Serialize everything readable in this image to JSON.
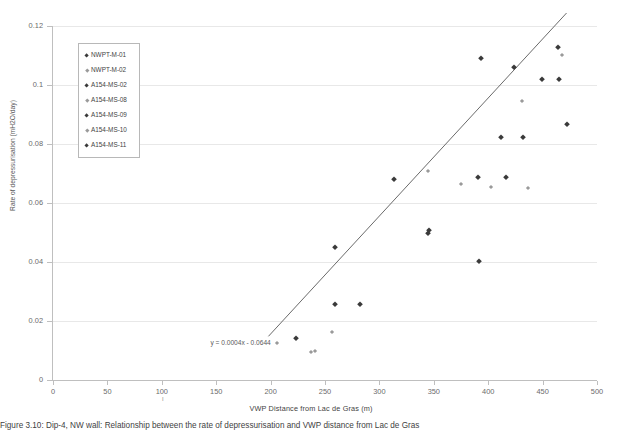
{
  "chart_data": {
    "type": "scatter",
    "title": "",
    "xlabel": "VWP Distance  from Lac de Gras (m)",
    "ylabel": "Rate of depressurisation (mH2O/day)",
    "xlim": [
      0,
      500
    ],
    "ylim": [
      0,
      0.12
    ],
    "xticks": [
      0,
      50,
      100,
      150,
      200,
      250,
      300,
      350,
      400,
      450,
      500
    ],
    "xticklabels": [
      "0",
      "50",
      "100",
      "150",
      "200",
      "250",
      "300",
      "350",
      "400",
      "450",
      "500"
    ],
    "yticks": [
      0,
      0.02,
      0.04,
      0.06,
      0.08,
      0.1,
      0.12
    ],
    "yticklabels": [
      "0",
      "0.02",
      "0.04",
      "0.06",
      "0.08",
      "0.1",
      "0.12"
    ],
    "grid": "horizontal",
    "legend_position": "upper-left-inside",
    "trendline": {
      "equation": "y = 0.0004x - 0.0644",
      "slope": 0.0004,
      "intercept": -0.0644,
      "x_start": 198,
      "x_end": 472
    },
    "series": [
      {
        "name": "NWPT-M-01",
        "marker": "dark",
        "points": [
          {
            "x": 223,
            "y": 0.0143
          },
          {
            "x": 259,
            "y": 0.0258
          },
          {
            "x": 282,
            "y": 0.0257
          },
          {
            "x": 345,
            "y": 0.05
          },
          {
            "x": 346,
            "y": 0.051
          },
          {
            "x": 392,
            "y": 0.0402
          }
        ]
      },
      {
        "name": "NWPT-M-02",
        "marker": "light",
        "points": [
          {
            "x": 206,
            "y": 0.0124
          },
          {
            "x": 241,
            "y": 0.0098
          },
          {
            "x": 256,
            "y": 0.0163
          }
        ]
      },
      {
        "name": "A154-MS-02",
        "marker": "dark",
        "points": [
          {
            "x": 259,
            "y": 0.045
          },
          {
            "x": 313,
            "y": 0.0681
          },
          {
            "x": 391,
            "y": 0.0687
          },
          {
            "x": 416,
            "y": 0.0688
          }
        ]
      },
      {
        "name": "A154-MS-08",
        "marker": "light",
        "points": [
          {
            "x": 237,
            "y": 0.0096
          },
          {
            "x": 345,
            "y": 0.0707
          },
          {
            "x": 375,
            "y": 0.0663
          },
          {
            "x": 403,
            "y": 0.0655
          },
          {
            "x": 437,
            "y": 0.0651
          }
        ]
      },
      {
        "name": "A154-MS-09",
        "marker": "dark",
        "points": [
          {
            "x": 412,
            "y": 0.0825
          },
          {
            "x": 432,
            "y": 0.0825
          },
          {
            "x": 449,
            "y": 0.1022
          },
          {
            "x": 465,
            "y": 0.102
          },
          {
            "x": 472,
            "y": 0.0868
          }
        ]
      },
      {
        "name": "A154-MS-10",
        "marker": "light",
        "points": [
          {
            "x": 431,
            "y": 0.0945
          },
          {
            "x": 468,
            "y": 0.1101
          }
        ]
      },
      {
        "name": "A154-MS-11",
        "marker": "dark",
        "points": [
          {
            "x": 393,
            "y": 0.1093
          },
          {
            "x": 424,
            "y": 0.1062
          },
          {
            "x": 464,
            "y": 0.1128
          }
        ]
      }
    ]
  },
  "legend": {
    "items": [
      {
        "label": "NWPT-M-01",
        "marker": "dark"
      },
      {
        "label": "NWPT-M-02",
        "marker": "light"
      },
      {
        "label": "A154-MS-02",
        "marker": "dark"
      },
      {
        "label": "A154-MS-08",
        "marker": "light"
      },
      {
        "label": "A154-MS-09",
        "marker": "dark"
      },
      {
        "label": "A154-MS-10",
        "marker": "light"
      },
      {
        "label": "A154-MS-11",
        "marker": "dark"
      }
    ]
  },
  "caption": {
    "text": "Figure 3.10:  Dip-4, NW wall: Relationship between the rate of depressurisation and VWP distance from Lac de Gras"
  }
}
